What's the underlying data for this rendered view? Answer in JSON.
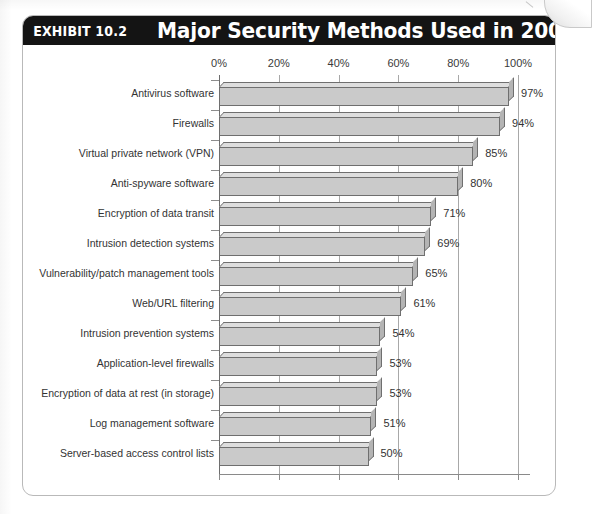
{
  "exhibit": {
    "number": "EXHIBIT 10.2",
    "title": "Major Security Methods Used in 2008"
  },
  "chart_data": {
    "type": "bar",
    "orientation": "horizontal",
    "title": "Major Security Methods Used in 2008",
    "xlabel": "",
    "ylabel": "",
    "xlim": [
      0,
      100
    ],
    "grid": true,
    "legend": false,
    "tick_labels": [
      "0%",
      "20%",
      "40%",
      "60%",
      "80%",
      "100%"
    ],
    "tick_values": [
      0,
      20,
      40,
      60,
      80,
      100
    ],
    "value_suffix": "%",
    "categories": [
      "Antivirus software",
      "Firewalls",
      "Virtual private network (VPN)",
      "Anti-spyware software",
      "Encryption of data transit",
      "Intrusion detection systems",
      "Vulnerability/patch management tools",
      "Web/URL filtering",
      "Intrusion prevention systems",
      "Application-level firewalls",
      "Encryption of data at rest (in storage)",
      "Log management software",
      "Server-based access control lists"
    ],
    "values": [
      97,
      94,
      85,
      80,
      71,
      69,
      65,
      61,
      54,
      53,
      53,
      51,
      50
    ],
    "value_labels": [
      "97%",
      "94%",
      "85%",
      "80%",
      "71%",
      "69%",
      "65%",
      "61%",
      "54%",
      "53%",
      "53%",
      "51%",
      "50%"
    ],
    "colors": {
      "bar_face": "#cacaca",
      "bar_top": "#dedede",
      "bar_side": "#b4b4b4",
      "bar_outline": "#6f6f6f",
      "gridline": "#a8a8a8",
      "axis": "#6d6d6d",
      "title_bar_background": "#141414",
      "title_text": "#ffffff",
      "label_text": "#333333",
      "panel_border": "#b9b9b9"
    }
  }
}
